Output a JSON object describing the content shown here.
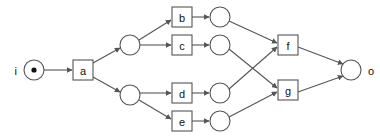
{
  "diagram": {
    "background_color": "#ffffff",
    "stroke_color": "#555555",
    "text_color": "#111111",
    "width": 380,
    "height": 140,
    "nodes": [
      {
        "id": "i",
        "label": "i",
        "shape": "circle-with-dot",
        "cx": 34,
        "cy": 70,
        "r": 10,
        "label_position": "left"
      },
      {
        "id": "a",
        "label": "a",
        "shape": "box",
        "x": 73,
        "y": 60,
        "w": 20,
        "h": 20
      },
      {
        "id": "n1",
        "label": "",
        "shape": "circle",
        "cx": 130,
        "cy": 45,
        "r": 10
      },
      {
        "id": "n2",
        "label": "",
        "shape": "circle",
        "cx": 130,
        "cy": 95,
        "r": 10
      },
      {
        "id": "b",
        "label": "b",
        "shape": "box",
        "x": 172,
        "y": 7,
        "w": 20,
        "h": 20
      },
      {
        "id": "c",
        "label": "c",
        "shape": "box",
        "x": 172,
        "y": 35,
        "w": 20,
        "h": 20
      },
      {
        "id": "d",
        "label": "d",
        "shape": "box",
        "x": 172,
        "y": 83,
        "w": 20,
        "h": 20
      },
      {
        "id": "e",
        "label": "e",
        "shape": "box",
        "x": 172,
        "y": 111,
        "w": 20,
        "h": 20
      },
      {
        "id": "n3",
        "label": "",
        "shape": "circle",
        "cx": 220,
        "cy": 17,
        "r": 10
      },
      {
        "id": "n4",
        "label": "",
        "shape": "circle",
        "cx": 220,
        "cy": 45,
        "r": 10
      },
      {
        "id": "n5",
        "label": "",
        "shape": "circle",
        "cx": 220,
        "cy": 93,
        "r": 10
      },
      {
        "id": "n6",
        "label": "",
        "shape": "circle",
        "cx": 220,
        "cy": 121,
        "r": 10
      },
      {
        "id": "f",
        "label": "f",
        "shape": "box",
        "x": 278,
        "y": 35,
        "w": 20,
        "h": 20
      },
      {
        "id": "g",
        "label": "g",
        "shape": "box",
        "x": 278,
        "y": 80,
        "w": 20,
        "h": 20
      },
      {
        "id": "o",
        "label": "o",
        "shape": "circle",
        "cx": 351,
        "cy": 70,
        "r": 10,
        "label_position": "right"
      }
    ],
    "edges": [
      {
        "from": "i",
        "to": "a",
        "x1": 44,
        "y1": 70,
        "x2": 72,
        "y2": 70
      },
      {
        "from": "a",
        "to": "n1",
        "x1": 93,
        "y1": 63,
        "x2": 120,
        "y2": 48
      },
      {
        "from": "a",
        "to": "n2",
        "x1": 93,
        "y1": 77,
        "x2": 120,
        "y2": 92
      },
      {
        "from": "n1",
        "to": "b",
        "x1": 139,
        "y1": 40,
        "x2": 171,
        "y2": 20
      },
      {
        "from": "n1",
        "to": "c",
        "x1": 140,
        "y1": 45,
        "x2": 171,
        "y2": 45
      },
      {
        "from": "n2",
        "to": "d",
        "x1": 140,
        "y1": 93,
        "x2": 171,
        "y2": 93
      },
      {
        "from": "n2",
        "to": "e",
        "x1": 139,
        "y1": 100,
        "x2": 171,
        "y2": 119
      },
      {
        "from": "b",
        "to": "n3",
        "x1": 192,
        "y1": 17,
        "x2": 209,
        "y2": 17
      },
      {
        "from": "c",
        "to": "n4",
        "x1": 192,
        "y1": 45,
        "x2": 209,
        "y2": 45
      },
      {
        "from": "d",
        "to": "n5",
        "x1": 192,
        "y1": 93,
        "x2": 209,
        "y2": 93
      },
      {
        "from": "e",
        "to": "n6",
        "x1": 192,
        "y1": 121,
        "x2": 209,
        "y2": 121
      },
      {
        "from": "n3",
        "to": "f",
        "x1": 229,
        "y1": 21,
        "x2": 277,
        "y2": 43
      },
      {
        "from": "n4",
        "to": "g",
        "x1": 229,
        "y1": 49,
        "x2": 277,
        "y2": 88
      },
      {
        "from": "n5",
        "to": "f",
        "x1": 229,
        "y1": 89,
        "x2": 277,
        "y2": 47
      },
      {
        "from": "n6",
        "to": "g",
        "x1": 229,
        "y1": 117,
        "x2": 277,
        "y2": 92
      },
      {
        "from": "f",
        "to": "o",
        "x1": 298,
        "y1": 47,
        "x2": 343,
        "y2": 64
      },
      {
        "from": "g",
        "to": "o",
        "x1": 298,
        "y1": 92,
        "x2": 343,
        "y2": 76
      }
    ]
  }
}
